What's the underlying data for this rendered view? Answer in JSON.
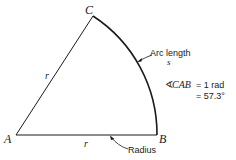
{
  "diagram": {
    "vertices": {
      "A": "A",
      "B": "B",
      "C": "C"
    },
    "side_labels": {
      "AC": "r",
      "AB": "r"
    },
    "arc_label": {
      "line1": "Arc length",
      "line2": "s"
    },
    "radius_label": "Radius",
    "angle_statement": {
      "line1_symbol": "∢",
      "line1_name": "CAB",
      "line1_value": "= 1 rad",
      "line2": "= 57.3°"
    },
    "angle_radians": 1,
    "angle_degrees": 57.3,
    "stroke_color": "#1a1a1a",
    "text_color": "#1a1a1a"
  }
}
